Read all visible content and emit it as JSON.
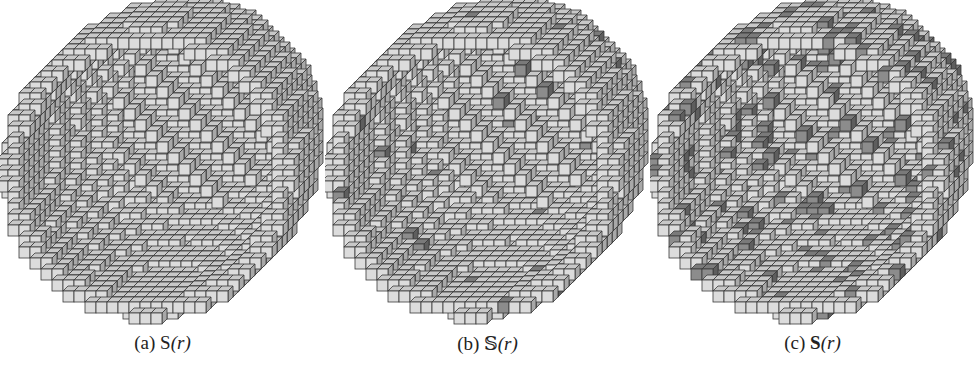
{
  "figure": {
    "panels": [
      {
        "id": "a",
        "label": "(a)",
        "symbol": "S",
        "symbol_style": "sans",
        "arg": "(r)",
        "dark_density": 0.0,
        "seed": 11,
        "left": 20,
        "center": [
          170,
          158
        ]
      },
      {
        "id": "b",
        "label": "(b)",
        "symbol": "𝕊",
        "symbol_style": "blackboard",
        "arg": "(r)",
        "dark_density": 0.02,
        "seed": 23,
        "left": 330,
        "center": [
          485,
          158
        ]
      },
      {
        "id": "c",
        "label": "(c)",
        "symbol": "S",
        "symbol_style": "bold",
        "arg": "(r)",
        "dark_density": 0.14,
        "seed": 37,
        "left": 645,
        "center": [
          805,
          158
        ]
      }
    ],
    "colors": {
      "cube_top": "#c8c8c8",
      "cube_front": "#dcdcdc",
      "cube_side": "#a8a8a8",
      "cube_dark_top": "#7a7a7a",
      "cube_dark_front": "#8c8c8c",
      "cube_dark_side": "#5e5e5e",
      "edge": "#3a3a3a",
      "background": "#ffffff"
    }
  }
}
